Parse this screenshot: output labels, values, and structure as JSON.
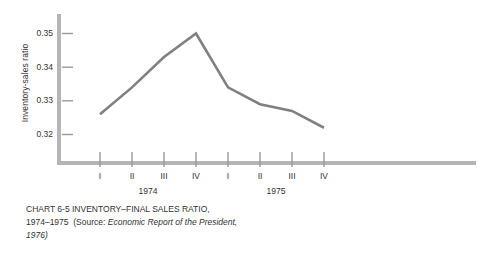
{
  "chart_data": {
    "type": "line",
    "title": "",
    "xlabel": "",
    "ylabel": "Inventory-sales ratio",
    "categories": [
      "I",
      "II",
      "III",
      "IV",
      "I",
      "II",
      "III",
      "IV"
    ],
    "groups": [
      {
        "label": "1974",
        "categories": [
          "I",
          "II",
          "III",
          "IV"
        ]
      },
      {
        "label": "1975",
        "categories": [
          "I",
          "II",
          "III",
          "IV"
        ]
      }
    ],
    "series": [
      {
        "name": "Inventory-final sales ratio",
        "values": [
          0.326,
          0.334,
          0.343,
          0.35,
          0.334,
          0.329,
          0.327,
          0.322
        ]
      }
    ],
    "yticks": [
      "0.32",
      "0.33",
      "0.34",
      "0.35"
    ],
    "ytick_values": [
      0.32,
      0.33,
      0.34,
      0.35
    ],
    "ylim": [
      0.3145,
      0.3535
    ],
    "grid": false,
    "legend": "none",
    "line_color": "#808080",
    "axis_color": "#b5b5b5"
  },
  "axis": {
    "y_title": "Inventory-sales ratio"
  },
  "caption": {
    "line1_prefix": "CHART 6-5",
    "line1_title": "INVENTORY–FINAL SALES RATIO,",
    "line2_years": "1974–1975",
    "line2_source_open": "(Source:",
    "line2_source_italic": "Economic Report of the President,",
    "line3_source_italic": "1976)"
  }
}
